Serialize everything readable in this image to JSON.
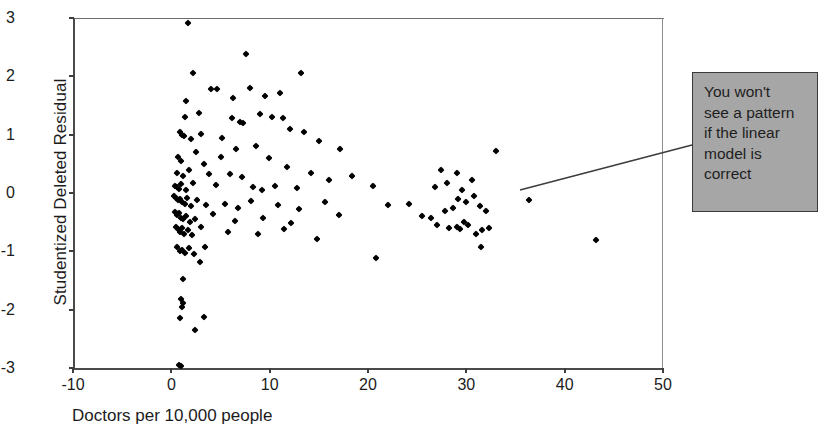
{
  "chart_data": {
    "type": "scatter",
    "title": "",
    "xlabel": "Doctors per 10,000 people",
    "ylabel": "Studentized Deleted Residual",
    "xlim": [
      -10,
      50
    ],
    "ylim": [
      -3,
      3
    ],
    "xticks": [
      -10,
      0,
      10,
      20,
      30,
      40,
      50
    ],
    "yticks": [
      3,
      2,
      1,
      0,
      -1,
      -2,
      -3
    ],
    "xtick_labels": [
      "-10",
      "0",
      "10",
      "20",
      "30",
      "40",
      "50"
    ],
    "ytick_labels": [
      "3",
      "2",
      "1",
      "0",
      "-1",
      "-2",
      "-3"
    ],
    "grid": false,
    "legend": null,
    "marker": "diamond",
    "marker_color": "#000000",
    "series": [
      {
        "name": "residuals",
        "points": [
          [
            1.7,
            2.92
          ],
          [
            2.2,
            2.05
          ],
          [
            7.6,
            2.38
          ],
          [
            11.0,
            1.72
          ],
          [
            13.2,
            2.06
          ],
          [
            1.5,
            1.57
          ],
          [
            2.8,
            1.38
          ],
          [
            4.0,
            1.78
          ],
          [
            4.6,
            1.78
          ],
          [
            6.3,
            1.63
          ],
          [
            8.0,
            1.8
          ],
          [
            9.5,
            1.66
          ],
          [
            11.4,
            1.28
          ],
          [
            1.4,
            1.3
          ],
          [
            3.0,
            1.02
          ],
          [
            6.2,
            1.28
          ],
          [
            7.0,
            1.22
          ],
          [
            7.3,
            1.2
          ],
          [
            9.0,
            1.35
          ],
          [
            10.2,
            1.3
          ],
          [
            12.1,
            1.1
          ],
          [
            0.9,
            1.04
          ],
          [
            1.1,
            1.0
          ],
          [
            1.3,
            0.98
          ],
          [
            2.0,
            0.93
          ],
          [
            5.2,
            0.95
          ],
          [
            6.6,
            0.75
          ],
          [
            8.6,
            0.8
          ],
          [
            13.5,
            1.05
          ],
          [
            0.7,
            0.62
          ],
          [
            1.0,
            0.55
          ],
          [
            2.5,
            0.7
          ],
          [
            3.3,
            0.5
          ],
          [
            5.0,
            0.62
          ],
          [
            9.9,
            0.6
          ],
          [
            15.0,
            0.9
          ],
          [
            17.2,
            0.75
          ],
          [
            0.6,
            0.35
          ],
          [
            1.2,
            0.3
          ],
          [
            1.8,
            0.4
          ],
          [
            3.8,
            0.32
          ],
          [
            6.0,
            0.33
          ],
          [
            7.2,
            0.28
          ],
          [
            11.8,
            0.45
          ],
          [
            14.2,
            0.35
          ],
          [
            16.0,
            0.22
          ],
          [
            18.4,
            0.3
          ],
          [
            0.4,
            0.12
          ],
          [
            0.6,
            0.1
          ],
          [
            0.8,
            0.07
          ],
          [
            1.0,
            0.15
          ],
          [
            1.5,
            0.05
          ],
          [
            2.2,
            0.18
          ],
          [
            4.5,
            0.14
          ],
          [
            8.3,
            0.1
          ],
          [
            9.2,
            0.06
          ],
          [
            10.5,
            0.12
          ],
          [
            12.8,
            0.08
          ],
          [
            20.5,
            0.12
          ],
          [
            0.3,
            -0.05
          ],
          [
            0.5,
            -0.08
          ],
          [
            0.7,
            -0.12
          ],
          [
            0.9,
            -0.1
          ],
          [
            1.1,
            -0.15
          ],
          [
            1.4,
            -0.18
          ],
          [
            1.6,
            -0.08
          ],
          [
            2.0,
            -0.22
          ],
          [
            2.6,
            -0.12
          ],
          [
            3.5,
            -0.2
          ],
          [
            5.5,
            -0.18
          ],
          [
            6.8,
            -0.25
          ],
          [
            8.1,
            -0.14
          ],
          [
            10.8,
            -0.2
          ],
          [
            13.0,
            -0.28
          ],
          [
            15.6,
            -0.16
          ],
          [
            22.0,
            -0.2
          ],
          [
            24.2,
            -0.18
          ],
          [
            0.4,
            -0.32
          ],
          [
            0.6,
            -0.38
          ],
          [
            0.8,
            -0.35
          ],
          [
            1.0,
            -0.42
          ],
          [
            1.2,
            -0.45
          ],
          [
            1.5,
            -0.4
          ],
          [
            1.9,
            -0.5
          ],
          [
            2.4,
            -0.44
          ],
          [
            4.2,
            -0.36
          ],
          [
            6.5,
            -0.48
          ],
          [
            9.3,
            -0.42
          ],
          [
            12.2,
            -0.52
          ],
          [
            17.0,
            -0.38
          ],
          [
            25.5,
            -0.4
          ],
          [
            26.4,
            -0.42
          ],
          [
            0.5,
            -0.58
          ],
          [
            0.7,
            -0.62
          ],
          [
            0.9,
            -0.66
          ],
          [
            1.1,
            -0.6
          ],
          [
            1.3,
            -0.7
          ],
          [
            1.7,
            -0.64
          ],
          [
            2.1,
            -0.72
          ],
          [
            3.0,
            -0.58
          ],
          [
            5.8,
            -0.66
          ],
          [
            8.8,
            -0.7
          ],
          [
            11.5,
            -0.62
          ],
          [
            14.8,
            -0.78
          ],
          [
            27.0,
            -0.55
          ],
          [
            28.2,
            -0.6
          ],
          [
            29.0,
            -0.58
          ],
          [
            29.4,
            -0.62
          ],
          [
            29.8,
            -0.5
          ],
          [
            30.2,
            -0.55
          ],
          [
            31.0,
            -0.7
          ],
          [
            31.6,
            -0.64
          ],
          [
            32.3,
            -0.6
          ],
          [
            27.8,
            -0.3
          ],
          [
            28.6,
            -0.25
          ],
          [
            29.2,
            -0.1
          ],
          [
            30.0,
            -0.15
          ],
          [
            30.8,
            -0.05
          ],
          [
            31.4,
            -0.22
          ],
          [
            32.0,
            -0.3
          ],
          [
            26.8,
            0.1
          ],
          [
            28.0,
            0.18
          ],
          [
            29.6,
            0.05
          ],
          [
            30.6,
            0.22
          ],
          [
            27.4,
            0.4
          ],
          [
            29.0,
            0.35
          ],
          [
            33.0,
            0.72
          ],
          [
            36.4,
            -0.12
          ],
          [
            43.2,
            -0.8
          ],
          [
            0.6,
            -0.92
          ],
          [
            0.9,
            -1.0
          ],
          [
            1.1,
            -0.98
          ],
          [
            1.4,
            -1.02
          ],
          [
            1.8,
            -0.95
          ],
          [
            2.3,
            -1.05
          ],
          [
            3.4,
            -0.92
          ],
          [
            2.9,
            -1.18
          ],
          [
            20.8,
            -1.12
          ],
          [
            31.5,
            -0.92
          ],
          [
            1.2,
            -1.48
          ],
          [
            1.0,
            -1.82
          ],
          [
            1.2,
            -1.88
          ],
          [
            1.1,
            -1.95
          ],
          [
            0.9,
            -2.15
          ],
          [
            3.3,
            -2.12
          ],
          [
            2.4,
            -2.35
          ],
          [
            0.8,
            -2.95
          ],
          [
            1.0,
            -2.97
          ]
        ]
      }
    ]
  },
  "annotation": {
    "name": "callout-box",
    "lines": [
      "You won't",
      "see a pattern",
      "if the linear",
      "model is",
      "correct"
    ],
    "background_color": "#a6a6a6",
    "border_color": "#3a3a3a",
    "leader_from": [
      520,
      190
    ],
    "leader_to": [
      692,
      145
    ]
  }
}
